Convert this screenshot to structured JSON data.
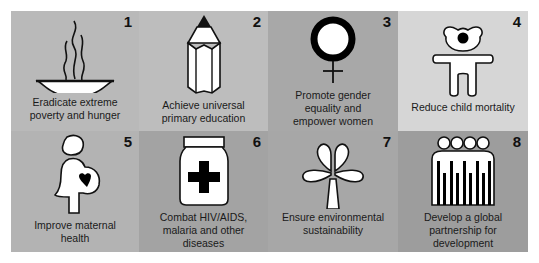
{
  "goals": [
    {
      "number": "1",
      "label": "Eradicate extreme poverty and hunger",
      "lines": [
        "Eradicate extreme",
        "poverty and hunger"
      ],
      "icon": "bowl-icon",
      "bg": "#b9b9b9"
    },
    {
      "number": "2",
      "label": "Achieve universal primary education",
      "lines": [
        "Achieve universal",
        "primary education"
      ],
      "icon": "pencil-icon",
      "bg": "#bdbdbd"
    },
    {
      "number": "3",
      "label": "Promote gender equality and empower women",
      "lines": [
        "Promote gender",
        "equality and",
        "empower women"
      ],
      "icon": "female-symbol-icon",
      "bg": "#a8a8a8"
    },
    {
      "number": "4",
      "label": "Reduce child mortality",
      "lines": [
        "Reduce child mortality"
      ],
      "icon": "child-icon",
      "bg": "#d6d6d6"
    },
    {
      "number": "5",
      "label": "Improve maternal health",
      "lines": [
        "Improve maternal",
        "health"
      ],
      "icon": "pregnant-woman-icon",
      "bg": "#b3b3b3"
    },
    {
      "number": "6",
      "label": "Combat HIV/AIDS, malaria and other diseases",
      "lines": [
        "Combat HIV/AIDS,",
        "malaria and other",
        "diseases"
      ],
      "icon": "medicine-jar-icon",
      "bg": "#a3a3a3"
    },
    {
      "number": "7",
      "label": "Ensure environmental sustainability",
      "lines": [
        "Ensure environmental",
        "sustainability"
      ],
      "icon": "tree-icon",
      "bg": "#a7a7a7"
    },
    {
      "number": "8",
      "label": "Develop a global partnership for development",
      "lines": [
        "Develop a global",
        "partnership for",
        "development"
      ],
      "icon": "people-group-icon",
      "bg": "#9d9d9d"
    }
  ]
}
